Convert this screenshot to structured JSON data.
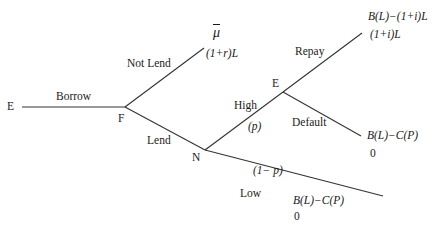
{
  "diagram": {
    "type": "game-tree",
    "nodes": {
      "root": {
        "label": "E"
      },
      "lender": {
        "label": "F"
      },
      "nature": {
        "label": "N"
      },
      "entrepreneur": {
        "label": "E"
      }
    },
    "edges": {
      "borrow": {
        "label": "Borrow"
      },
      "not_lend": {
        "label": "Not Lend"
      },
      "lend": {
        "label": "Lend"
      },
      "high": {
        "label": "High",
        "prob": "(p)"
      },
      "low": {
        "label": "Low",
        "prob": "(1− p)"
      },
      "repay": {
        "label": "Repay"
      },
      "default": {
        "label": "Default"
      }
    },
    "payoffs": {
      "not_lend": {
        "line1": "μ",
        "line2": "(1+r)L"
      },
      "repay": {
        "line1": "B(L)−(1+i)L",
        "line2": "(1+i)L"
      },
      "default": {
        "line1": "B(L)−C(P)",
        "line2": "0"
      },
      "low": {
        "line1": "B(L)−C(P)",
        "line2": "0"
      }
    }
  }
}
